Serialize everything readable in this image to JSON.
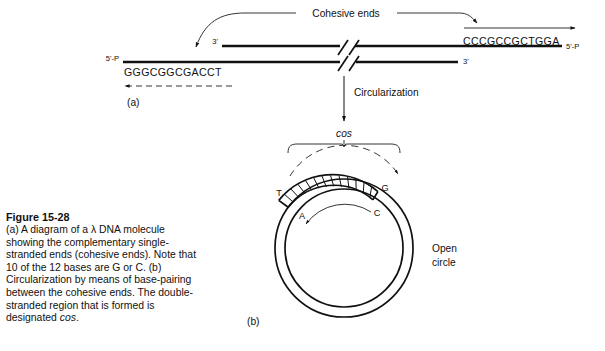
{
  "figure": {
    "caption_title": "Figure 15-28",
    "caption_body_1": "(a) A diagram of a ",
    "caption_lambda": "λ",
    "caption_body_2": " DNA molecule showing the complementary single-stranded ends (cohesive ends). Note that 10 of the 12 bases are G or C. (b) Circularization by means of base-pairing between the cohesive ends. The double-stranded region that is formed is designated ",
    "caption_cos": "cos",
    "caption_body_3": "."
  },
  "panel_a": {
    "label": "(a)",
    "title": "Cohesive ends",
    "left_end_label": "5'-P",
    "left_sequence": "GGGCGGCGACCT",
    "top_strand_left_label": "3'",
    "bottom_strand_right_label": "3'",
    "right_end_label": "5'-P",
    "right_sequence": "CCCGCCGCTGGA"
  },
  "transition": {
    "label": "Circularization"
  },
  "panel_b": {
    "label": "(b)",
    "cos_label": "cos",
    "open_circle_label_line1": "Open",
    "open_circle_label_line2": "circle",
    "base_top_left": "T",
    "base_bottom_left": "A",
    "base_top_right": "G",
    "base_bottom_right": "C",
    "rung_count": 12
  },
  "colors": {
    "ink": "#111111",
    "background": "#ffffff"
  }
}
